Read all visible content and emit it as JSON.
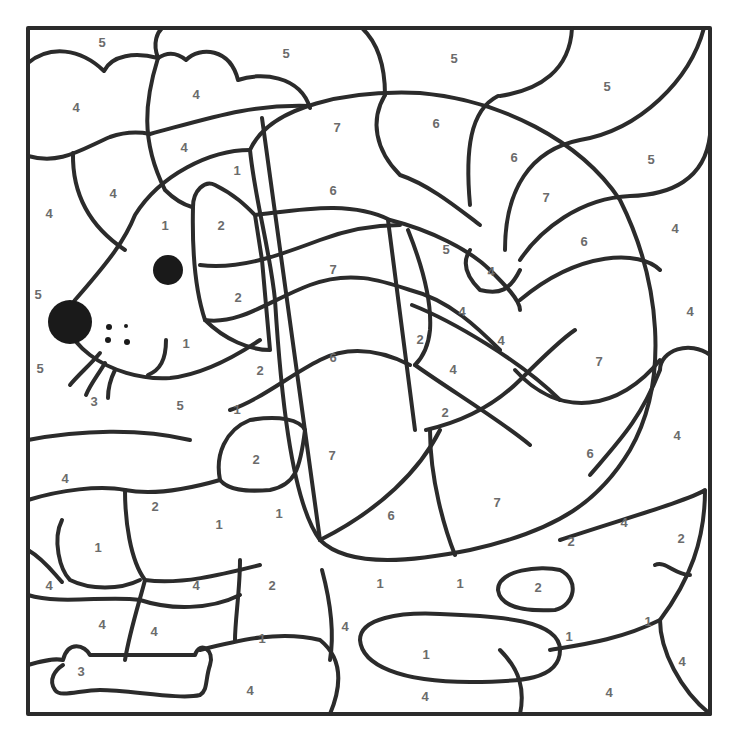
{
  "page": {
    "colors": {
      "line": "#2b2b2b",
      "number": "#6b6b6b",
      "background": "#ffffff"
    }
  },
  "regions": [
    {
      "n": "5",
      "x": 102,
      "y": 42
    },
    {
      "n": "5",
      "x": 286,
      "y": 53
    },
    {
      "n": "5",
      "x": 454,
      "y": 58
    },
    {
      "n": "5",
      "x": 607,
      "y": 86
    },
    {
      "n": "4",
      "x": 76,
      "y": 107
    },
    {
      "n": "4",
      "x": 196,
      "y": 94
    },
    {
      "n": "7",
      "x": 337,
      "y": 127
    },
    {
      "n": "6",
      "x": 436,
      "y": 123
    },
    {
      "n": "4",
      "x": 184,
      "y": 147
    },
    {
      "n": "1",
      "x": 237,
      "y": 170
    },
    {
      "n": "6",
      "x": 333,
      "y": 190
    },
    {
      "n": "6",
      "x": 514,
      "y": 157
    },
    {
      "n": "5",
      "x": 651,
      "y": 159
    },
    {
      "n": "4",
      "x": 113,
      "y": 193
    },
    {
      "n": "4",
      "x": 49,
      "y": 213
    },
    {
      "n": "1",
      "x": 165,
      "y": 225
    },
    {
      "n": "2",
      "x": 221,
      "y": 225
    },
    {
      "n": "7",
      "x": 546,
      "y": 197
    },
    {
      "n": "4",
      "x": 675,
      "y": 228
    },
    {
      "n": "5",
      "x": 446,
      "y": 249
    },
    {
      "n": "4",
      "x": 491,
      "y": 271
    },
    {
      "n": "7",
      "x": 333,
      "y": 269
    },
    {
      "n": "6",
      "x": 584,
      "y": 241
    },
    {
      "n": "5",
      "x": 38,
      "y": 294
    },
    {
      "n": "2",
      "x": 238,
      "y": 297
    },
    {
      "n": "4",
      "x": 462,
      "y": 311
    },
    {
      "n": "4",
      "x": 690,
      "y": 311
    },
    {
      "n": "1",
      "x": 186,
      "y": 343
    },
    {
      "n": "2",
      "x": 420,
      "y": 339
    },
    {
      "n": "4",
      "x": 501,
      "y": 340
    },
    {
      "n": "6",
      "x": 333,
      "y": 357
    },
    {
      "n": "7",
      "x": 599,
      "y": 361
    },
    {
      "n": "5",
      "x": 40,
      "y": 368
    },
    {
      "n": "2",
      "x": 260,
      "y": 370
    },
    {
      "n": "4",
      "x": 453,
      "y": 369
    },
    {
      "n": "3",
      "x": 94,
      "y": 401
    },
    {
      "n": "5",
      "x": 180,
      "y": 405
    },
    {
      "n": "1",
      "x": 237,
      "y": 409
    },
    {
      "n": "2",
      "x": 445,
      "y": 412
    },
    {
      "n": "4",
      "x": 677,
      "y": 435
    },
    {
      "n": "2",
      "x": 256,
      "y": 459
    },
    {
      "n": "7",
      "x": 332,
      "y": 455
    },
    {
      "n": "6",
      "x": 590,
      "y": 453
    },
    {
      "n": "4",
      "x": 65,
      "y": 478
    },
    {
      "n": "2",
      "x": 155,
      "y": 506
    },
    {
      "n": "1",
      "x": 219,
      "y": 524
    },
    {
      "n": "1",
      "x": 279,
      "y": 513
    },
    {
      "n": "6",
      "x": 391,
      "y": 515
    },
    {
      "n": "7",
      "x": 497,
      "y": 502
    },
    {
      "n": "4",
      "x": 624,
      "y": 522
    },
    {
      "n": "2",
      "x": 681,
      "y": 538
    },
    {
      "n": "2",
      "x": 571,
      "y": 541
    },
    {
      "n": "1",
      "x": 98,
      "y": 547
    },
    {
      "n": "4",
      "x": 49,
      "y": 585
    },
    {
      "n": "4",
      "x": 196,
      "y": 585
    },
    {
      "n": "2",
      "x": 272,
      "y": 585
    },
    {
      "n": "1",
      "x": 380,
      "y": 583
    },
    {
      "n": "1",
      "x": 460,
      "y": 583
    },
    {
      "n": "2",
      "x": 538,
      "y": 587
    },
    {
      "n": "4",
      "x": 102,
      "y": 624
    },
    {
      "n": "4",
      "x": 154,
      "y": 631
    },
    {
      "n": "1",
      "x": 262,
      "y": 638
    },
    {
      "n": "4",
      "x": 345,
      "y": 626
    },
    {
      "n": "1",
      "x": 569,
      "y": 636
    },
    {
      "n": "1",
      "x": 648,
      "y": 621
    },
    {
      "n": "1",
      "x": 426,
      "y": 654
    },
    {
      "n": "4",
      "x": 682,
      "y": 661
    },
    {
      "n": "3",
      "x": 81,
      "y": 671
    },
    {
      "n": "4",
      "x": 250,
      "y": 690
    },
    {
      "n": "4",
      "x": 425,
      "y": 696
    },
    {
      "n": "4",
      "x": 609,
      "y": 692
    }
  ]
}
